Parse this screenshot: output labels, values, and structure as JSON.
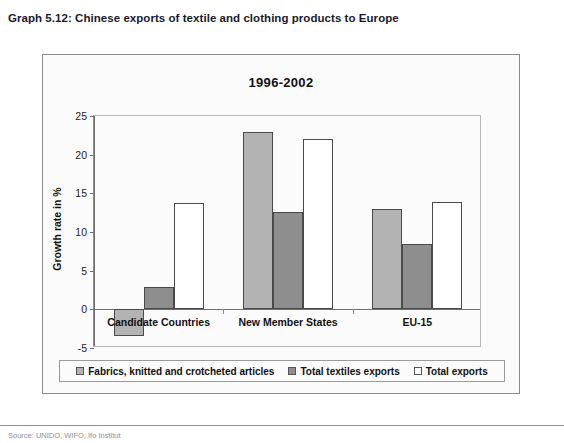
{
  "figure": {
    "caption": "Graph 5.12: Chinese exports of textile and clothing products to Europe",
    "source_note": "Source:  UNIDO, WIFO, Ifo Institut"
  },
  "chart_data": {
    "type": "bar",
    "title": "1996-2002",
    "xlabel": "",
    "ylabel": "Growth rate in %",
    "categories": [
      "Candidate Countries",
      "New Member States",
      "EU-15"
    ],
    "series": [
      {
        "name": "Fabrics, knitted and crotcheted articles",
        "color": "#b3b3b3",
        "values": [
          -3.5,
          22.9,
          13.0
        ]
      },
      {
        "name": "Total textiles exports",
        "color": "#8e8e8e",
        "values": [
          2.9,
          12.6,
          8.4
        ]
      },
      {
        "name": "Total exports",
        "color": "#ffffff",
        "values": [
          13.8,
          22.0,
          13.9
        ]
      }
    ],
    "ylim": [
      -5,
      25
    ],
    "yticks": [
      25,
      20,
      15,
      10,
      5,
      0,
      -5
    ],
    "ytick_labels": [
      "25",
      "20",
      "15",
      "10",
      "5",
      "0",
      "-5"
    ],
    "grid": false,
    "legend_position": "bottom"
  }
}
